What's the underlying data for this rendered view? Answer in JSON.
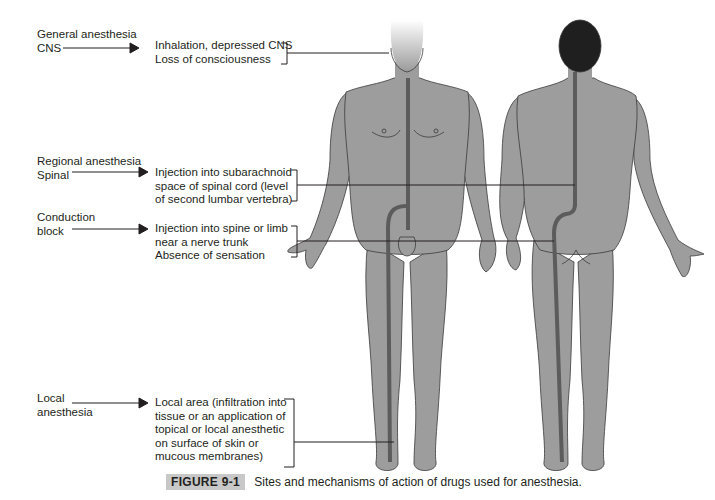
{
  "colors": {
    "body_fill": "#9d9d9d",
    "body_outline": "#3a3a3a",
    "nerve_path": "#5c5c5c",
    "hair": "#1f1f1f",
    "line": "#231f20",
    "caption_tag_bg": "#c8c8c8"
  },
  "rows": [
    {
      "label_lines": [
        "General anesthesia",
        "CNS"
      ],
      "description_lines": [
        "Inhalation, depressed CNS",
        "Loss of consciousness"
      ]
    },
    {
      "label_lines": [
        "Regional anesthesia",
        "Spinal"
      ],
      "description_lines": [
        "Injection into subarachnoid",
        "space of spinal cord (level",
        "of second lumbar vertebra)"
      ]
    },
    {
      "label_lines": [
        "Conduction",
        "block"
      ],
      "description_lines": [
        "Injection into spine or limb",
        "near a nerve trunk",
        "Absence of sensation"
      ]
    },
    {
      "label_lines": [
        "Local",
        "anesthesia"
      ],
      "description_lines": [
        "Local area (infiltration into",
        "tissue or an application of",
        "topical or local anesthetic",
        "on surface of skin or",
        "mucous membranes)"
      ]
    }
  ],
  "figures": {
    "front_view": "anterior-body",
    "back_view": "posterior-body"
  },
  "caption": {
    "tag": "FIGURE 9-1",
    "text": "Sites and mechanisms of action of drugs used for anesthesia."
  }
}
